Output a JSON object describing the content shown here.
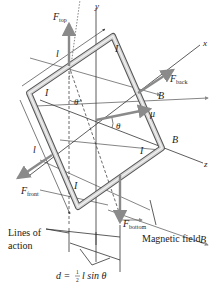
{
  "figure": {
    "axes": {
      "x": "x",
      "y": "y",
      "z": "z"
    },
    "forces": {
      "top": {
        "symbol": "F",
        "subscript": "top"
      },
      "back": {
        "symbol": "F",
        "subscript": "back"
      },
      "front": {
        "symbol": "F",
        "subscript": "front"
      },
      "bottom": {
        "symbol": "F",
        "subscript": "bottom"
      }
    },
    "field_symbol": "B",
    "moment_symbol": "μ",
    "current_symbol": "I",
    "length_symbol": "l",
    "angle_symbol": "θ",
    "labels": {
      "lines_of_action_1": "Lines of",
      "lines_of_action_2": "action",
      "magnetic_field": "Magnetic field",
      "distance_formula_d": "d =",
      "distance_formula_num": "1",
      "distance_formula_den": "2",
      "distance_formula_rest": "l sin θ"
    },
    "colors": {
      "arrow": "#8a8a8a",
      "wire": "#c9c9c9",
      "line": "#333333"
    }
  }
}
